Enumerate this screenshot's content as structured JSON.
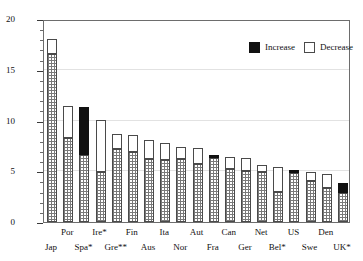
{
  "chart_data": {
    "type": "bar",
    "title": "",
    "xlabel": "",
    "ylabel": "Public inv. as % of Government outlays",
    "ylim": [
      0,
      20
    ],
    "yticks": [
      0,
      5,
      10,
      15,
      20
    ],
    "ytick_labels": [
      "0",
      "5",
      "10",
      "15",
      "20"
    ],
    "grid": true,
    "legend_position": "top-right",
    "legend": [
      {
        "key": "increase",
        "label": "Increase",
        "color": "#111111"
      },
      {
        "key": "decrease",
        "label": "Decrease",
        "color": "#ffffff"
      }
    ],
    "series_description": "Each bar shows a base level (hatched) plus a change segment: white above the base means a decrease from an earlier higher level; black above the base means an increase.",
    "categories": [
      "Jap",
      "Por",
      "Spa*",
      "Ire*",
      "Gre**",
      "Fin",
      "Aus",
      "Ita",
      "Nor",
      "Aut",
      "Fra",
      "Can",
      "Ger",
      "Net",
      "Bel*",
      "US",
      "Swe",
      "Den",
      "UK*"
    ],
    "series": [
      {
        "name": "Base (current)",
        "values": [
          16.6,
          8.3,
          6.6,
          4.9,
          7.2,
          6.9,
          6.2,
          6.1,
          6.2,
          5.7,
          6.3,
          5.2,
          5.0,
          4.9,
          3.0,
          4.8,
          4.0,
          3.4,
          2.9
        ]
      },
      {
        "name": "Total (top of bar)",
        "values": [
          18.0,
          11.4,
          11.3,
          10.1,
          8.7,
          8.6,
          8.1,
          7.8,
          7.4,
          7.3,
          6.6,
          6.4,
          6.3,
          5.6,
          5.4,
          5.1,
          4.9,
          4.7,
          3.8
        ]
      },
      {
        "name": "Change direction",
        "values": [
          "decrease",
          "decrease",
          "increase",
          "decrease",
          "decrease",
          "decrease",
          "decrease",
          "decrease",
          "decrease",
          "decrease",
          "increase",
          "decrease",
          "decrease",
          "decrease",
          "decrease",
          "increase",
          "decrease",
          "decrease",
          "increase"
        ]
      }
    ]
  }
}
